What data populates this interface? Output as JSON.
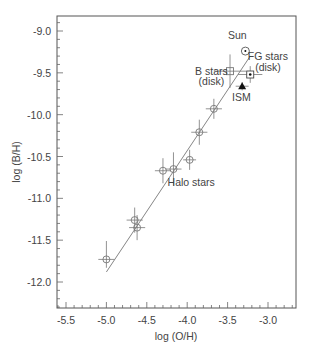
{
  "chart_data": {
    "type": "scatter",
    "title": "",
    "xlabel": "log (O/H)",
    "ylabel": "log (B/H)",
    "xlim": [
      -5.6,
      -2.7
    ],
    "ylim": [
      -12.3,
      -8.8
    ],
    "xticks": [
      "-5.5",
      "-5.0",
      "-4.5",
      "-4.0",
      "-3.5",
      "-3.0"
    ],
    "xtick_values": [
      -5.5,
      -5.0,
      -4.5,
      -4.0,
      -3.5,
      -3.0
    ],
    "yticks": [
      "-9.0",
      "-9.5",
      "-10.0",
      "-10.5",
      "-11.0",
      "-11.5",
      "-12.0"
    ],
    "ytick_values": [
      -9.0,
      -9.5,
      -10.0,
      -10.5,
      -11.0,
      -11.5,
      -12.0
    ],
    "grid": false,
    "series": [
      {
        "name": "Halo stars",
        "marker": "open-circle-errorbar",
        "points": [
          {
            "x": -5.0,
            "y": -11.73,
            "xerr": 0.1,
            "yerr_up": 0.22,
            "yerr_down": 0.1
          },
          {
            "x": -4.65,
            "y": -11.26,
            "xerr": 0.1,
            "yerr": 0.15
          },
          {
            "x": -4.62,
            "y": -11.35,
            "xerr": 0.1,
            "yerr": 0.15
          },
          {
            "x": -4.3,
            "y": -10.67,
            "xerr": 0.1,
            "yerr": 0.15
          },
          {
            "x": -4.17,
            "y": -10.65,
            "xerr": 0.1,
            "yerr": 0.2
          },
          {
            "x": -3.97,
            "y": -10.54,
            "xerr": 0.08,
            "yerr": 0.12
          },
          {
            "x": -3.85,
            "y": -10.21,
            "xerr": 0.1,
            "yerr": 0.15
          },
          {
            "x": -3.67,
            "y": -9.93,
            "xerr": 0.1,
            "yerr": 0.12
          }
        ]
      },
      {
        "name": "B stars (disk)",
        "marker": "open-square-errorbar",
        "points": [
          {
            "x": -3.47,
            "y": -9.48,
            "xerr": 0.2,
            "yerr": 0.2
          }
        ]
      },
      {
        "name": "FG stars (disk)",
        "marker": "dotted-square-errorbar",
        "points": [
          {
            "x": -3.22,
            "y": -9.52,
            "xerr": 0.15,
            "yerr": 0.1
          }
        ]
      },
      {
        "name": "ISM",
        "marker": "filled-triangle",
        "points": [
          {
            "x": -3.32,
            "y": -9.66,
            "xerr": 0.08,
            "yerr": 0.05
          }
        ]
      },
      {
        "name": "Sun",
        "marker": "circle-dot",
        "points": [
          {
            "x": -3.28,
            "y": -9.24
          }
        ]
      }
    ],
    "fit_line": {
      "x": [
        -5.0,
        -3.22
      ],
      "y": [
        -11.88,
        -9.3
      ]
    },
    "annotations": [
      {
        "text": "Sun",
        "x": -3.38,
        "y": -9.1
      },
      {
        "text": "FG stars",
        "x": -3.0,
        "y": -9.35
      },
      {
        "text": "(disk)",
        "x": -3.0,
        "y": -9.48
      },
      {
        "text": "B stars",
        "x": -3.7,
        "y": -9.52
      },
      {
        "text": "(disk)",
        "x": -3.7,
        "y": -9.65
      },
      {
        "text": "ISM",
        "x": -3.33,
        "y": -9.84
      },
      {
        "text": "Halo stars",
        "x": -3.95,
        "y": -10.85
      }
    ]
  }
}
